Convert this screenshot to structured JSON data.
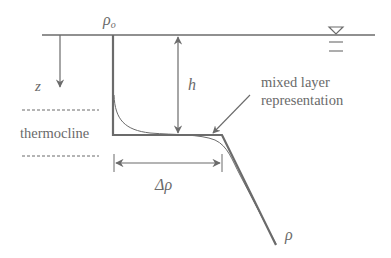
{
  "diagram": {
    "type": "mixed-layer density profile schematic",
    "labels": {
      "surface_density": "ρ",
      "surface_density_sub": "o",
      "depth_axis": "z",
      "mixed_layer_depth": "h",
      "thermocline": "thermocline",
      "density_jump": "Δρ",
      "density_axis": "ρ",
      "annotation_line1": "mixed layer",
      "annotation_line2": "representation"
    },
    "colors": {
      "line": "#6b6b6b",
      "text": "#6a6a6a",
      "background": "#ffffff"
    }
  }
}
